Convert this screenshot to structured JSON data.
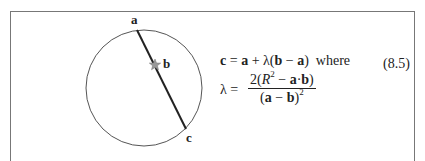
{
  "figure": {
    "circle": {
      "cx": 144,
      "cy": 88,
      "r": 58,
      "stroke": "#555555"
    },
    "chord": {
      "x1": 137,
      "y1": 30,
      "x2": 186,
      "y2": 129,
      "stroke": "#222222"
    },
    "star": {
      "x": 155,
      "y": 65,
      "color": "#888888"
    },
    "labels": {
      "a": "a",
      "b": "b",
      "c": "c"
    }
  },
  "equation": {
    "line1_lhs": "c",
    "line1_eq": " = ",
    "line1_a": "a",
    "line1_plus": " + λ(",
    "line1_b": "b",
    "line1_minus": " − ",
    "line1_a2": "a",
    "line1_close": ")",
    "line1_where": "  where",
    "line2_lambda": "λ = ",
    "numerator_pre": "2(",
    "numerator_R": "R",
    "numerator_exp": "2",
    "numerator_minus": " − ",
    "numerator_a": "a",
    "numerator_dot": "·",
    "numerator_b": "b",
    "numerator_close": ")",
    "denominator_open": "(",
    "denominator_a": "a",
    "denominator_minus": " − ",
    "denominator_b": "b",
    "denominator_close": ")",
    "denominator_exp": "2",
    "number": "(8.5)"
  }
}
